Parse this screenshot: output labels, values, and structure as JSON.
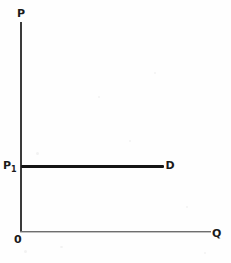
{
  "chart_data": {
    "type": "line",
    "title": "",
    "subtitle": "",
    "xlabel": "Q",
    "ylabel": "P",
    "origin_label": "0",
    "xlim": [
      0,
      100
    ],
    "ylim": [
      0,
      100
    ],
    "grid": false,
    "legend_position": "inline-right",
    "series": [
      {
        "name": "D",
        "label": "D",
        "label_position": "right-end",
        "description": "perfectly elastic (horizontal) demand curve at price P1",
        "x": [
          0,
          75
        ],
        "y": [
          31,
          31
        ]
      }
    ],
    "annotations": [
      {
        "name": "price-level",
        "text": "P1",
        "text_display": "P",
        "subscript": "1",
        "axis": "y",
        "value": 31
      },
      {
        "name": "curve-label",
        "text": "D",
        "axis": "inline",
        "x": 78,
        "y": 31
      },
      {
        "name": "y-axis-label",
        "text": "P",
        "axis": "y-top"
      },
      {
        "name": "x-axis-label",
        "text": "Q",
        "axis": "x-right"
      },
      {
        "name": "origin-label",
        "text": "0",
        "axis": "origin"
      }
    ]
  },
  "figure": {
    "axis_y_label": "P",
    "axis_x_label": "Q",
    "origin_label": "0",
    "price_label": "P",
    "price_subscript": "1",
    "curve_label": "D",
    "colors": {
      "background": "#fefefe",
      "axis_y": "#3a3a3a",
      "axis_x": "#6e6e6e",
      "curve": "#141414",
      "text": "#1a1a1a"
    }
  }
}
